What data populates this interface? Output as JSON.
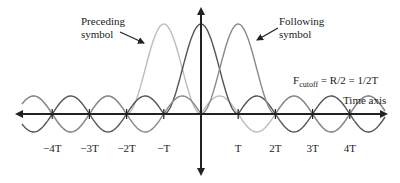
{
  "labels": {
    "preceding_line1": "Preceding",
    "preceding_line2": "symbol",
    "following_line1": "Following",
    "following_line2": "symbol",
    "cutoff_F": "F",
    "cutoff_sub": "cutoff",
    "cutoff_rest": " = R/2 = 1/2T",
    "time_axis": "Time axis"
  },
  "ticks": [
    {
      "label": "−4T",
      "k": -4
    },
    {
      "label": "−3T",
      "k": -3
    },
    {
      "label": "−2T",
      "k": -2
    },
    {
      "label": "−T",
      "k": -1
    },
    {
      "label": "T",
      "k": 1
    },
    {
      "label": "2T",
      "k": 2
    },
    {
      "label": "3T",
      "k": 3
    },
    {
      "label": "4T",
      "k": 4
    }
  ],
  "pulses": [
    {
      "name": "preceding",
      "shift_T": -1,
      "color": "#bdbdbd"
    },
    {
      "name": "current",
      "shift_T": 0,
      "color": "#555555"
    },
    {
      "name": "following",
      "shift_T": 1,
      "color": "#8a8a8a"
    }
  ],
  "colors": {
    "axis": "#222222"
  }
}
